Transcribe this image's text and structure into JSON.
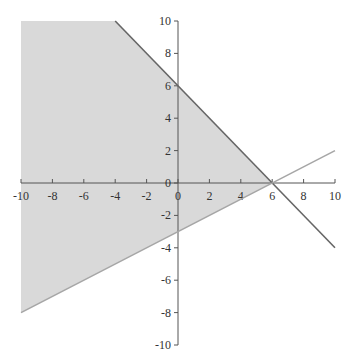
{
  "chart_data": {
    "type": "line",
    "title": "",
    "xlabel": "",
    "ylabel": "",
    "xlim": [
      -10,
      10
    ],
    "ylim": [
      -10,
      10
    ],
    "grid": false,
    "legend": null,
    "x_ticks": [
      -10,
      -8,
      -6,
      -4,
      -2,
      0,
      2,
      4,
      6,
      8,
      10
    ],
    "y_ticks": [
      -10,
      -8,
      -6,
      -4,
      -2,
      0,
      2,
      4,
      6,
      8,
      10
    ],
    "series": [
      {
        "name": "y = -x + 6",
        "color": "#666666",
        "points": [
          [
            -4,
            10
          ],
          [
            10,
            -4
          ]
        ]
      },
      {
        "name": "y = 0.5x - 3",
        "color": "#a6a6a6",
        "points": [
          [
            -10,
            -8
          ],
          [
            10,
            2
          ]
        ]
      }
    ],
    "shaded_region": {
      "color": "#d9d9d9",
      "description": "y <= -x + 6 and y >= 0.5x - 3 and y <= 10, x >= -10",
      "vertices": [
        [
          -10,
          10
        ],
        [
          -4,
          10
        ],
        [
          6,
          0
        ],
        [
          -10,
          -8
        ]
      ]
    }
  }
}
